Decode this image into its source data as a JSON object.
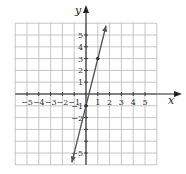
{
  "chart_data": {
    "type": "line",
    "title": "",
    "xlabel": "x",
    "ylabel": "y",
    "xlim": [
      -6,
      6
    ],
    "ylim": [
      -6,
      6
    ],
    "grid": true,
    "x_tick_labels": [
      "−5",
      "−4",
      "−3",
      "−2",
      "−1",
      "1",
      "2",
      "3",
      "4",
      "5"
    ],
    "y_tick_labels": [
      "5",
      "4",
      "3",
      "2",
      "1",
      "−1",
      "−2",
      "−5"
    ],
    "series": [
      {
        "name": "y = 4x − 1",
        "equation": "y = 4x - 1",
        "slope": 4,
        "intercept": -1,
        "x": [
          -1.2,
          1.7
        ],
        "y": [
          -5.8,
          5.8
        ],
        "marked_points": [
          [
            0,
            -1
          ],
          [
            1,
            3
          ]
        ],
        "color": "#555555",
        "arrows": "both"
      }
    ]
  },
  "labels": {
    "x_axis": "x",
    "y_axis": "y"
  }
}
